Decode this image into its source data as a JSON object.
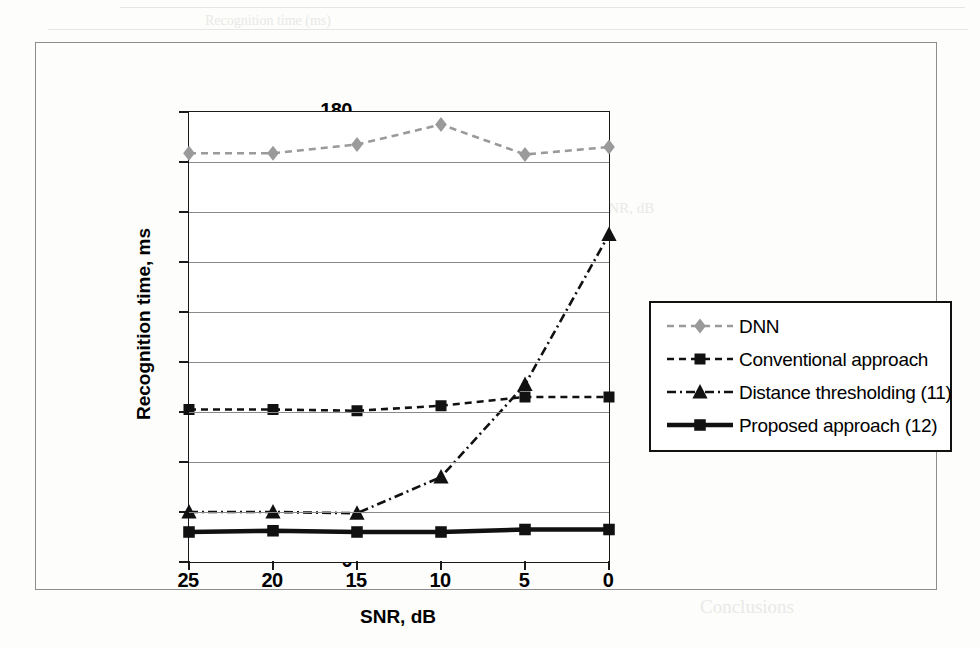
{
  "chart_data": {
    "type": "line",
    "title": "",
    "xlabel": "SNR, dB",
    "ylabel": "Recognition time, ms",
    "x": [
      25,
      20,
      15,
      10,
      5,
      0
    ],
    "categories": [
      "25",
      "20",
      "15",
      "10",
      "5",
      "0"
    ],
    "xlim": [
      25,
      0
    ],
    "ylim": [
      0,
      180
    ],
    "yticks": [
      0,
      20,
      40,
      60,
      80,
      100,
      120,
      140,
      160,
      180
    ],
    "xticks": [
      "25",
      "20",
      "15",
      "10",
      "5",
      "0"
    ],
    "grid": "horizontal",
    "legend_position": "right-outside",
    "series": [
      {
        "name": "DNN",
        "marker": "diamond",
        "line_style": "dashed",
        "color": "#9a9a9a",
        "values": [
          163.5,
          163.5,
          167,
          175,
          163,
          166
        ]
      },
      {
        "name": "Conventional approach",
        "marker": "square",
        "line_style": "dashed",
        "color": "#111111",
        "values": [
          61,
          61,
          60.5,
          62.5,
          66,
          66
        ]
      },
      {
        "name": "Distance thresholding (11)",
        "marker": "triangle",
        "line_style": "dash-dot",
        "color": "#111111",
        "values": [
          20,
          20,
          19.5,
          34,
          71,
          131
        ]
      },
      {
        "name": "Proposed approach (12)",
        "marker": "square",
        "line_style": "solid-bold",
        "color": "#111111",
        "values": [
          12,
          12.5,
          12,
          12,
          13,
          13
        ]
      }
    ]
  },
  "axes": {
    "y_tick_labels": [
      "180",
      "160",
      "140",
      "120",
      "100",
      "80",
      "60",
      "40",
      "20",
      "0"
    ],
    "x_tick_labels": [
      "25",
      "20",
      "15",
      "10",
      "5",
      "0"
    ],
    "x_title": "SNR, dB",
    "y_title": "Recognition time, ms"
  },
  "legend": {
    "items": [
      {
        "label": "DNN",
        "marker": "diamond-marker",
        "style": "dashed-gray"
      },
      {
        "label": "Conventional approach",
        "marker": "square-marker",
        "style": "dashed-black"
      },
      {
        "label": "Distance thresholding (11)",
        "marker": "triangle-marker",
        "style": "dashdot-black"
      },
      {
        "label": "Proposed approach (12)",
        "marker": "square-marker",
        "style": "solid-bold-black"
      }
    ]
  },
  "background_artifacts": {
    "note": "faint scanner bleed-through text behind figure",
    "lines": [
      "Recognition time (ms)",
      "with deep switching",
      "Proposed approach (12) . E",
      "recognition time metric",
      "Fig. 1.106. a. Effect of delay time on",
      "SNR, dB",
      "Conclusions"
    ]
  }
}
